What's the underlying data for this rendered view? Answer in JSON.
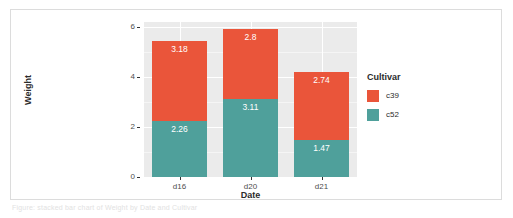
{
  "caption": {
    "text": "Figure: stacked bar chart of Weight by Date and Cultivar"
  },
  "chart_data": {
    "type": "bar",
    "stacked": true,
    "title": "",
    "subtitle": "",
    "xlabel": "Date",
    "ylabel": "Weight",
    "categories": [
      "d16",
      "d20",
      "d21"
    ],
    "ylim": [
      0,
      6.2
    ],
    "yticks": [
      0,
      2,
      4,
      6
    ],
    "ytick_labels": [
      "0",
      "2",
      "4",
      "6"
    ],
    "grid": true,
    "grid_color": "#ffffff",
    "panel_background": "#ebebeb",
    "legend": {
      "title": "Cultivar",
      "position": "right",
      "entries": [
        {
          "label": "c39",
          "color": "#ea553a"
        },
        {
          "label": "c52",
          "color": "#4fa09b"
        }
      ]
    },
    "series": [
      {
        "name": "c39",
        "color": "#ea553a",
        "values": [
          3.18,
          2.8,
          2.74
        ],
        "labels": [
          "3.18",
          "2.8",
          "2.74"
        ]
      },
      {
        "name": "c52",
        "color": "#4fa09b",
        "values": [
          2.26,
          3.11,
          1.47
        ],
        "labels": [
          "2.26",
          "3.11",
          "1.47"
        ]
      }
    ],
    "stack_totals": [
      5.44,
      5.91,
      4.21
    ]
  }
}
